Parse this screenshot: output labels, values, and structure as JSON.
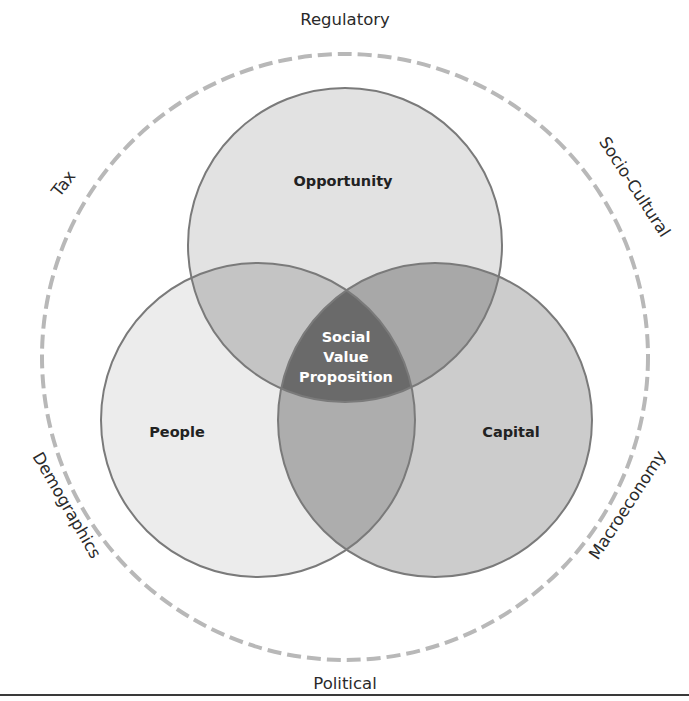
{
  "diagram": {
    "type": "venn",
    "circles": [
      {
        "id": "opportunity",
        "label": "Opportunity",
        "fill": "#e2e2e2"
      },
      {
        "id": "people",
        "label": "People",
        "fill": "#ececec"
      },
      {
        "id": "capital",
        "label": "Capital",
        "fill": "#cccccc"
      }
    ],
    "overlaps": {
      "opportunity_people": "#c4c4c4",
      "opportunity_capital": "#a8a8a8",
      "people_capital": "#adadad"
    },
    "center": {
      "lines": [
        "Social",
        "Value",
        "Proposition"
      ],
      "fill": "#6a6a6a"
    },
    "outline_color": "#7a7a7a",
    "ring": {
      "dash_color": "#b8b8b8",
      "labels": {
        "top": "Regulatory",
        "top_right": "Socio-Cultural",
        "bottom_right": "Macroeconomy",
        "bottom": "Political",
        "bottom_left": "Demographics",
        "top_left": "Tax"
      }
    }
  }
}
